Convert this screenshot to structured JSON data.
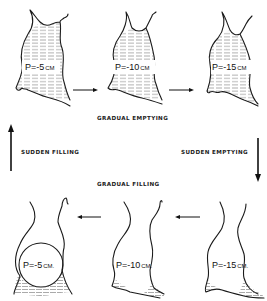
{
  "diagram": {
    "type": "cyclic state diagram",
    "top_row": [
      {
        "id": "top-1",
        "pressure": "P=-5",
        "unit": "CM",
        "fill": "full"
      },
      {
        "id": "top-2",
        "pressure": "P=-10",
        "unit": "CM",
        "fill": "full"
      },
      {
        "id": "top-3",
        "pressure": "P=-15",
        "unit": "CM",
        "fill": "full"
      }
    ],
    "bottom_row": [
      {
        "id": "bottom-1",
        "pressure": "P=-5",
        "unit": "CM.",
        "fill": "partial"
      },
      {
        "id": "bottom-2",
        "pressure": "P=-10",
        "unit": "CM.",
        "fill": "minimal"
      },
      {
        "id": "bottom-3",
        "pressure": "P=-15",
        "unit": "CM.",
        "fill": "minimal"
      }
    ],
    "transitions": {
      "top": "GRADUAL   EMPTYING",
      "right": "SUDDEN   EMPTYING",
      "bottom": "GRADUAL   FILLING",
      "left": "SUDDEN   FILLING"
    },
    "colors": {
      "ink": "#1a1a1a",
      "background": "#ffffff",
      "hatch": "#555555"
    }
  }
}
